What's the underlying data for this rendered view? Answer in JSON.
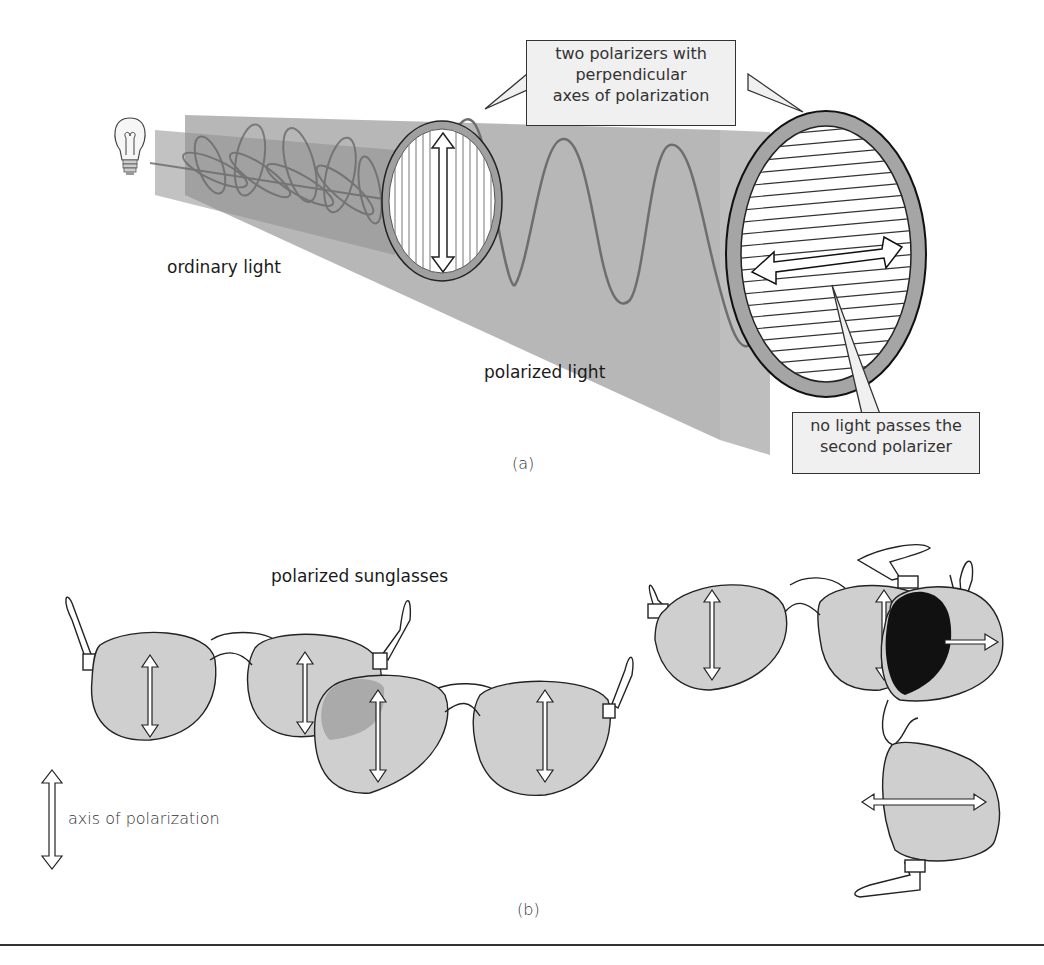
{
  "figure": {
    "panel_a": {
      "caption": "(a)",
      "labels": {
        "ordinary_light": "ordinary light",
        "polarized_light": "polarized light"
      },
      "callout_top": {
        "lines": [
          "two polarizers with",
          "perpendicular",
          "axes of polarization"
        ]
      },
      "callout_bottom": {
        "lines": [
          "no light passes the",
          "second polarizer"
        ]
      },
      "icons": {
        "light_source": "light-bulb-icon",
        "first_polarizer_axis": "vertical-double-arrow",
        "second_polarizer_axis": "horizontal-double-arrow"
      }
    },
    "panel_b": {
      "caption": "(b)",
      "title": "polarized sunglasses",
      "legend": {
        "icon": "vertical-double-arrow",
        "label": "axis of polarization"
      }
    }
  },
  "colors": {
    "beam": "#a8a8a8",
    "beam_dark": "#8c8c8c",
    "wave": "#6e6e6e",
    "ring": "#a0a0a0",
    "lens": "#cfcfcf",
    "lens_overlap": "#9a9a9a",
    "blocked": "#111111",
    "callout_bg": "#f0f0f0",
    "outline": "#222222"
  }
}
